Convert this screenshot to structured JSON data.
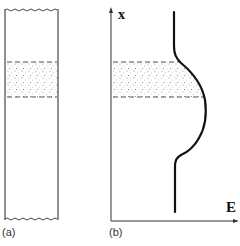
{
  "figure": {
    "panels": [
      {
        "id": "a",
        "label": "(a)",
        "description": "Vertical column segment with a dotted (doped/stippled) band bounded by dashed lines"
      },
      {
        "id": "b",
        "label": "(b)",
        "description": "Field profile E versus position x showing a bulge across the stippled band"
      }
    ],
    "axes": {
      "y_label": "x",
      "x_label": "E"
    },
    "colors": {
      "line": "#111111",
      "dash": "#555555",
      "stipple": "#777777",
      "background": "#ffffff"
    }
  }
}
